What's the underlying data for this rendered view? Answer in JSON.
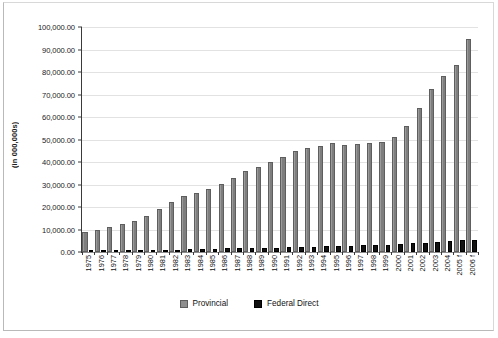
{
  "chart_data": {
    "type": "bar",
    "title": "",
    "subtitle": "",
    "xlabel": "",
    "ylabel": "(in 000,000s)",
    "ylim": [
      0,
      100000
    ],
    "ytick_step": 10000,
    "grid": "horizontal",
    "legend_position": "bottom-center",
    "categories": [
      "1975",
      "1976",
      "1977",
      "1978",
      "1979",
      "1980",
      "1981",
      "1982",
      "1983",
      "1984",
      "1985",
      "1986",
      "1987",
      "1988",
      "1989",
      "1990",
      "1991",
      "1992",
      "1993",
      "1994",
      "1995",
      "1996",
      "1997",
      "1998",
      "1999",
      "2000",
      "2001",
      "2002",
      "2003",
      "2004",
      "2005 f",
      "2006 f"
    ],
    "ytick_labels": [
      "0.00",
      "10,000.00",
      "20,000.00",
      "30,000.00",
      "40,000.00",
      "50,000.00",
      "60,000.00",
      "70,000.00",
      "80,000.00",
      "90,000.00",
      "100,000.00"
    ],
    "series": [
      {
        "name": "Provincial",
        "color": "#8a8a8a",
        "values": [
          8800,
          10000,
          11000,
          12500,
          13800,
          16000,
          19000,
          22400,
          24700,
          26200,
          28000,
          30400,
          32800,
          35800,
          37800,
          40000,
          42200,
          44800,
          46200,
          47000,
          48400,
          47600,
          47900,
          48600,
          49100,
          51000,
          56000,
          63800,
          72500,
          78200,
          83200,
          94500
        ]
      },
      {
        "name": "Federal Direct",
        "color": "#121212",
        "values": [
          700,
          750,
          800,
          850,
          900,
          950,
          1000,
          1050,
          1200,
          1350,
          1500,
          1600,
          1700,
          1800,
          1900,
          2000,
          2100,
          2300,
          2400,
          2500,
          2600,
          2700,
          2900,
          3100,
          3300,
          3500,
          3800,
          4200,
          4600,
          4900,
          5200,
          5500
        ]
      }
    ]
  },
  "legend": {
    "items": [
      {
        "label": "Provincial",
        "swatch": "provincial"
      },
      {
        "label": "Federal Direct",
        "swatch": "federal"
      }
    ]
  }
}
